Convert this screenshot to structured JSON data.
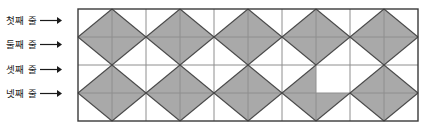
{
  "figure": {
    "title": "",
    "background_color": "#ffffff"
  },
  "labels": [
    {
      "id": "row-1",
      "text": "첫째 줄",
      "arrow": "arrow-right-icon"
    },
    {
      "id": "row-2",
      "text": "둘째 줄",
      "arrow": "arrow-right-icon"
    },
    {
      "id": "row-3",
      "text": "셋째 줄",
      "arrow": "arrow-right-icon"
    },
    {
      "id": "row-4",
      "text": "넷째 줄",
      "arrow": "arrow-right-icon"
    }
  ],
  "grid": {
    "columns": 10,
    "rows": 4,
    "origin_x": 78,
    "origin_y": 9,
    "cell_width": 34,
    "cell_height": 28,
    "outer_border_color": "#3a3a3a",
    "grid_line_color": "#8e8e8e",
    "diagonal_line_color": "#4a4a4a",
    "shade_color": "#a9a9a9",
    "empty_color": "#ffffff",
    "shaded_triangles": [
      {
        "row": 1,
        "col": 1,
        "part": "lower-right"
      },
      {
        "row": 1,
        "col": 2,
        "part": "lower-left"
      },
      {
        "row": 1,
        "col": 3,
        "part": "lower-right"
      },
      {
        "row": 1,
        "col": 4,
        "part": "lower-left"
      },
      {
        "row": 1,
        "col": 5,
        "part": "lower-right"
      },
      {
        "row": 1,
        "col": 6,
        "part": "lower-left"
      },
      {
        "row": 1,
        "col": 7,
        "part": "lower-right"
      },
      {
        "row": 1,
        "col": 8,
        "part": "lower-left"
      },
      {
        "row": 1,
        "col": 9,
        "part": "lower-right"
      },
      {
        "row": 1,
        "col": 10,
        "part": "lower-left"
      },
      {
        "row": 2,
        "col": 1,
        "part": "upper-right"
      },
      {
        "row": 2,
        "col": 2,
        "part": "upper-left"
      },
      {
        "row": 2,
        "col": 3,
        "part": "upper-right"
      },
      {
        "row": 2,
        "col": 4,
        "part": "upper-left"
      },
      {
        "row": 2,
        "col": 5,
        "part": "upper-right"
      },
      {
        "row": 2,
        "col": 6,
        "part": "upper-left"
      },
      {
        "row": 2,
        "col": 7,
        "part": "upper-right"
      },
      {
        "row": 2,
        "col": 8,
        "part": "upper-left"
      },
      {
        "row": 2,
        "col": 9,
        "part": "upper-right"
      },
      {
        "row": 2,
        "col": 10,
        "part": "upper-left"
      },
      {
        "row": 3,
        "col": 1,
        "part": "lower-right"
      },
      {
        "row": 3,
        "col": 2,
        "part": "lower-left"
      },
      {
        "row": 3,
        "col": 3,
        "part": "lower-right"
      },
      {
        "row": 3,
        "col": 4,
        "part": "lower-left"
      },
      {
        "row": 3,
        "col": 5,
        "part": "lower-right"
      },
      {
        "row": 3,
        "col": 6,
        "part": "lower-left"
      },
      {
        "row": 3,
        "col": 7,
        "part": "lower-right"
      },
      {
        "row": 3,
        "col": 9,
        "part": "lower-right"
      },
      {
        "row": 3,
        "col": 10,
        "part": "lower-left"
      },
      {
        "row": 4,
        "col": 1,
        "part": "upper-right"
      },
      {
        "row": 4,
        "col": 2,
        "part": "upper-left"
      },
      {
        "row": 4,
        "col": 3,
        "part": "upper-right"
      },
      {
        "row": 4,
        "col": 4,
        "part": "upper-left"
      },
      {
        "row": 4,
        "col": 5,
        "part": "upper-right"
      },
      {
        "row": 4,
        "col": 6,
        "part": "upper-left"
      },
      {
        "row": 4,
        "col": 7,
        "part": "upper-right"
      },
      {
        "row": 4,
        "col": 8,
        "part": "upper-left"
      },
      {
        "row": 4,
        "col": 9,
        "part": "upper-right"
      },
      {
        "row": 4,
        "col": 10,
        "part": "upper-left"
      }
    ],
    "missing_triangle": {
      "row": 3,
      "col": 8,
      "part": "lower-left"
    },
    "diagonals": [
      {
        "row": 1,
        "col": 1,
        "dir": "bl-tr"
      },
      {
        "row": 1,
        "col": 2,
        "dir": "tl-br"
      },
      {
        "row": 1,
        "col": 3,
        "dir": "bl-tr"
      },
      {
        "row": 1,
        "col": 4,
        "dir": "tl-br"
      },
      {
        "row": 1,
        "col": 5,
        "dir": "bl-tr"
      },
      {
        "row": 1,
        "col": 6,
        "dir": "tl-br"
      },
      {
        "row": 1,
        "col": 7,
        "dir": "bl-tr"
      },
      {
        "row": 1,
        "col": 8,
        "dir": "tl-br"
      },
      {
        "row": 1,
        "col": 9,
        "dir": "bl-tr"
      },
      {
        "row": 1,
        "col": 10,
        "dir": "tl-br"
      },
      {
        "row": 2,
        "col": 1,
        "dir": "tl-br"
      },
      {
        "row": 2,
        "col": 2,
        "dir": "bl-tr"
      },
      {
        "row": 2,
        "col": 3,
        "dir": "tl-br"
      },
      {
        "row": 2,
        "col": 4,
        "dir": "bl-tr"
      },
      {
        "row": 2,
        "col": 5,
        "dir": "tl-br"
      },
      {
        "row": 2,
        "col": 6,
        "dir": "bl-tr"
      },
      {
        "row": 2,
        "col": 7,
        "dir": "tl-br"
      },
      {
        "row": 2,
        "col": 8,
        "dir": "bl-tr"
      },
      {
        "row": 2,
        "col": 9,
        "dir": "tl-br"
      },
      {
        "row": 2,
        "col": 10,
        "dir": "bl-tr"
      },
      {
        "row": 3,
        "col": 1,
        "dir": "bl-tr"
      },
      {
        "row": 3,
        "col": 2,
        "dir": "tl-br"
      },
      {
        "row": 3,
        "col": 3,
        "dir": "bl-tr"
      },
      {
        "row": 3,
        "col": 4,
        "dir": "tl-br"
      },
      {
        "row": 3,
        "col": 5,
        "dir": "bl-tr"
      },
      {
        "row": 3,
        "col": 6,
        "dir": "tl-br"
      },
      {
        "row": 3,
        "col": 7,
        "dir": "bl-tr"
      },
      {
        "row": 3,
        "col": 9,
        "dir": "bl-tr"
      },
      {
        "row": 3,
        "col": 10,
        "dir": "tl-br"
      },
      {
        "row": 4,
        "col": 1,
        "dir": "tl-br"
      },
      {
        "row": 4,
        "col": 2,
        "dir": "bl-tr"
      },
      {
        "row": 4,
        "col": 3,
        "dir": "tl-br"
      },
      {
        "row": 4,
        "col": 4,
        "dir": "bl-tr"
      },
      {
        "row": 4,
        "col": 5,
        "dir": "tl-br"
      },
      {
        "row": 4,
        "col": 6,
        "dir": "bl-tr"
      },
      {
        "row": 4,
        "col": 7,
        "dir": "tl-br"
      },
      {
        "row": 4,
        "col": 8,
        "dir": "bl-tr"
      },
      {
        "row": 4,
        "col": 9,
        "dir": "tl-br"
      },
      {
        "row": 4,
        "col": 10,
        "dir": "bl-tr"
      }
    ]
  },
  "label_positions": [
    {
      "x": 6,
      "y": 16
    },
    {
      "x": 6,
      "y": 40
    },
    {
      "x": 6,
      "y": 65
    },
    {
      "x": 6,
      "y": 89
    }
  ]
}
